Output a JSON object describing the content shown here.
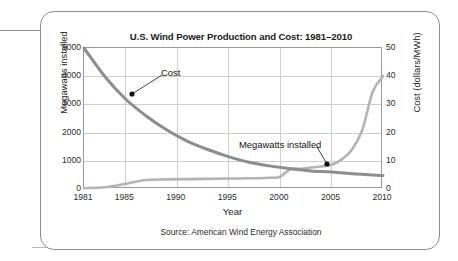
{
  "figure": {
    "title": "U.S. Wind Power Production and Cost: 1981–2010",
    "source": "Source: American Wind Energy Association",
    "colors": {
      "cost_line": "#8d8d8d",
      "megawatts_line": "#b4b4b4",
      "grid": "#cfcfcf",
      "axis": "#9a9a9a",
      "text": "#1b1b1b",
      "card_border": "#8d8d8d",
      "marker": "#111111"
    }
  },
  "chart_data": {
    "type": "line",
    "title": "U.S. Wind Power Production and Cost: 1981–2010",
    "xlabel": "Year",
    "ylabel": "Megawatts installed",
    "y2label": "Cost (dollars/MWh)",
    "xlim": [
      1981,
      2010
    ],
    "ylim": [
      0,
      5000
    ],
    "y2lim": [
      0,
      50
    ],
    "xticks": [
      1981,
      1985,
      1990,
      1995,
      2000,
      2005,
      2010
    ],
    "xticklabels": [
      "1981",
      "1985",
      "1990",
      "1995",
      "2000",
      "2005",
      "2010"
    ],
    "yticks": [
      0,
      1000,
      2000,
      3000,
      4000,
      5000
    ],
    "yticklabels": [
      "0",
      "1000",
      "2000",
      "3000",
      "4000",
      "5000"
    ],
    "y2ticks": [
      0,
      10,
      20,
      30,
      40,
      50
    ],
    "y2ticklabels": [
      "0",
      "10",
      "20",
      "30",
      "40",
      "50"
    ],
    "grid": true,
    "legend": "none (in-plot annotations with leader lines)",
    "series": [
      {
        "name": "Cost",
        "axis": "right",
        "unit": "dollars/MWh",
        "x": [
          1981,
          1983,
          1985,
          1987,
          1989,
          1991,
          1993,
          1995,
          1997,
          1999,
          2001,
          2003,
          2005,
          2007,
          2010
        ],
        "values": [
          50,
          40,
          32,
          26,
          21,
          17,
          14,
          11.5,
          9.5,
          8.2,
          7.2,
          6.4,
          6.0,
          5.4,
          4.8
        ]
      },
      {
        "name": "Megawatts installed",
        "axis": "left",
        "unit": "megawatts",
        "x": [
          1981,
          1983,
          1985,
          1987,
          1989,
          1991,
          1993,
          1995,
          1997,
          1999,
          2000,
          2001,
          2002,
          2003,
          2004,
          2005,
          2006,
          2007,
          2008,
          2009,
          2010
        ],
        "values": [
          30,
          60,
          180,
          320,
          340,
          350,
          360,
          370,
          380,
          400,
          430,
          700,
          720,
          760,
          800,
          860,
          1050,
          1400,
          2100,
          3450,
          4000
        ]
      }
    ],
    "annotations": [
      {
        "label": "Cost",
        "series": "Cost",
        "point_x": 1985,
        "point_y2_value": 32,
        "label_x_px": 120,
        "label_y_px": 55,
        "point_x_px": 131,
        "point_y_px": 93
      },
      {
        "label": "Megawatts installed",
        "series": "Megawatts installed",
        "point_x": 2005,
        "point_y_value": 860,
        "label_x_px": 198,
        "label_y_px": 127,
        "point_x_px": 326,
        "point_y_px": 163
      }
    ]
  }
}
